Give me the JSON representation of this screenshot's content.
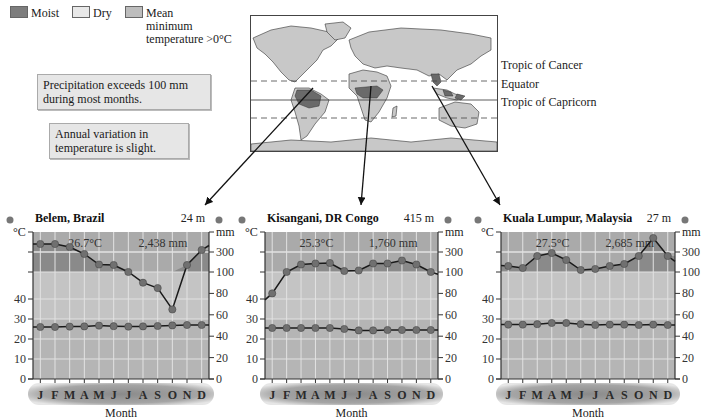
{
  "legend": {
    "items": [
      {
        "label": "Moist",
        "color": "#7d7d7d"
      },
      {
        "label": "Dry",
        "color": "#e8e8e8"
      },
      {
        "label": "Mean minimum temperature >0°C",
        "line1": "Mean",
        "line2": "minimum",
        "line3": "temperature >0°C",
        "color": "#bdbdbd"
      }
    ]
  },
  "notes": {
    "precipitation": [
      "Precipitation exceeds 100 mm",
      "during most months."
    ],
    "temperature": [
      "Annual variation in",
      "temperature is slight."
    ]
  },
  "map": {
    "latitudes": [
      {
        "label": "Tropic of Cancer",
        "style": "dashed"
      },
      {
        "label": "Equator",
        "style": "solid"
      },
      {
        "label": "Tropic of Capricorn",
        "style": "dashed"
      }
    ]
  },
  "colors": {
    "moist_band": "#8a8a8a",
    "dry_band": "#c4c4c4",
    "temp_band": "#b4b4b4",
    "line": "#1a1a1a",
    "marker": "#707070",
    "grid": "#e2e2e2"
  },
  "axes": {
    "left_unit": "°C",
    "right_unit": "mm",
    "left_ticks": [
      "0",
      "10",
      "20",
      "30",
      "40"
    ],
    "right_ticks": [
      "0",
      "20",
      "40",
      "60",
      "80",
      "100",
      "300"
    ],
    "xlabel": "Month",
    "months": [
      "J",
      "F",
      "M",
      "A",
      "M",
      "J",
      "J",
      "A",
      "S",
      "O",
      "N",
      "D"
    ]
  },
  "chart_data": [
    {
      "type": "line",
      "title": "Belem, Brazil",
      "elevation": "24 m",
      "annotation_temp": "26.7°C",
      "annotation_precip": "2,438 mm",
      "xlabel": "Month",
      "ylabel_left": "°C",
      "ylabel_right": "mm",
      "categories": [
        "J",
        "F",
        "M",
        "A",
        "M",
        "J",
        "J",
        "A",
        "S",
        "O",
        "N",
        "D"
      ],
      "series": [
        {
          "name": "Precipitation (mm)",
          "axis": "right",
          "values": [
            340,
            340,
            325,
            280,
            175,
            170,
            100,
            90,
            85,
            65,
            170,
            310
          ]
        },
        {
          "name": "Temperature (°C)",
          "axis": "left",
          "values": [
            26.0,
            26.0,
            26.2,
            26.3,
            26.7,
            26.4,
            26.2,
            26.3,
            26.5,
            26.8,
            27.0,
            27.0
          ]
        }
      ],
      "ylim_left": [
        0,
        40
      ],
      "yticks_right": [
        0,
        20,
        40,
        60,
        80,
        100,
        300
      ],
      "grid": true
    },
    {
      "type": "line",
      "title": "Kisangani, DR Congo",
      "elevation": "415 m",
      "annotation_temp": "25.3°C",
      "annotation_precip": "1,760 mm",
      "xlabel": "Month",
      "ylabel_left": "°C",
      "ylabel_right": "mm",
      "categories": [
        "J",
        "F",
        "M",
        "A",
        "M",
        "J",
        "J",
        "A",
        "S",
        "O",
        "N",
        "D"
      ],
      "series": [
        {
          "name": "Precipitation (mm)",
          "axis": "right",
          "values": [
            80,
            100,
            175,
            185,
            190,
            110,
            115,
            185,
            185,
            215,
            175,
            100
          ]
        },
        {
          "name": "Temperature (°C)",
          "axis": "left",
          "values": [
            25.5,
            25.5,
            25.5,
            25.5,
            25.5,
            25.0,
            24.3,
            24.3,
            24.5,
            24.5,
            24.5,
            24.5
          ]
        }
      ],
      "ylim_left": [
        0,
        40
      ],
      "yticks_right": [
        0,
        20,
        40,
        60,
        80,
        100,
        300
      ],
      "grid": true
    },
    {
      "type": "line",
      "title": "Kuala Lumpur, Malaysia",
      "elevation": "27 m",
      "annotation_temp": "27.5°C",
      "annotation_precip": "2,685 mm",
      "xlabel": "Month",
      "ylabel_left": "°C",
      "ylabel_right": "mm",
      "categories": [
        "J",
        "F",
        "M",
        "A",
        "M",
        "J",
        "J",
        "A",
        "S",
        "O",
        "N",
        "D"
      ],
      "series": [
        {
          "name": "Precipitation (mm)",
          "axis": "right",
          "values": [
            160,
            140,
            260,
            290,
            220,
            120,
            130,
            160,
            180,
            260,
            370,
            260
          ]
        },
        {
          "name": "Temperature (°C)",
          "axis": "left",
          "values": [
            27.2,
            27.2,
            27.4,
            28.0,
            28.0,
            27.4,
            27.0,
            27.2,
            27.2,
            27.0,
            27.2,
            27.0
          ]
        }
      ],
      "ylim_left": [
        0,
        40
      ],
      "yticks_right": [
        0,
        20,
        40,
        60,
        80,
        100,
        300
      ],
      "grid": true
    }
  ]
}
